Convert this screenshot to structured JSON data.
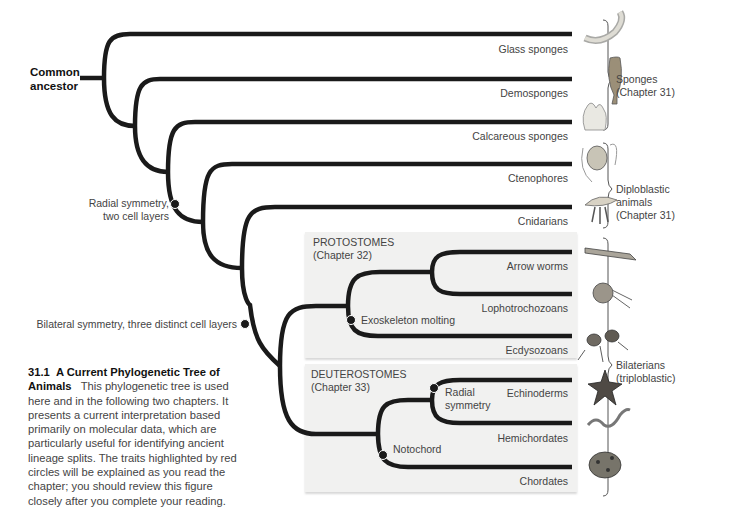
{
  "figure": {
    "root_label": [
      "Common",
      "ancestor"
    ],
    "taxa": [
      {
        "name": "Glass sponges",
        "icon": "glass-sponge-icon"
      },
      {
        "name": "Demosponges",
        "icon": "demosponge-icon"
      },
      {
        "name": "Calcareous sponges",
        "icon": "calcareous-sponge-icon"
      },
      {
        "name": "Ctenophores",
        "icon": "ctenophore-icon"
      },
      {
        "name": "Cnidarians",
        "icon": "jellyfish-icon"
      },
      {
        "name": "Arrow worms",
        "icon": "arrow-worm-icon"
      },
      {
        "name": "Lophotrochozoans",
        "icon": "nautilus-icon"
      },
      {
        "name": "Ecdysozoans",
        "icon": "mite-icon"
      },
      {
        "name": "Echinoderms",
        "icon": "starfish-icon"
      },
      {
        "name": "Hemichordates",
        "icon": "acorn-worm-icon"
      },
      {
        "name": "Chordates",
        "icon": "frog-icon"
      }
    ],
    "traits": {
      "radial_two_layers": [
        "Radial symmetry,",
        "two cell layers"
      ],
      "bilateral": "Bilateral symmetry, three distinct cell layers",
      "exoskeleton": "Exoskeleton molting",
      "radial_symmetry": [
        "Radial",
        "symmetry"
      ],
      "notochord": "Notochord"
    },
    "boxes": {
      "protostomes": {
        "title": "PROTOSTOMES",
        "chapter": "(Chapter 32)"
      },
      "deuterostomes": {
        "title": "DEUTEROSTOMES",
        "chapter": "(Chapter 33)"
      }
    },
    "groups": [
      {
        "name": "Sponges",
        "chapter": "(Chapter 31)"
      },
      {
        "name": "Diploblastic",
        "line2": "animals",
        "chapter": "(Chapter 31)"
      },
      {
        "name": "Bilaterians",
        "chapter": "(triploblastic)"
      }
    ],
    "colors": {
      "branch": "#1a1a1a",
      "trait_dot": "#1a1a1a",
      "box_bg": "#f1f1f0"
    }
  },
  "caption": {
    "number": "31.1",
    "title": "A Current Phylogenetic Tree of Animals",
    "body": "This phylogenetic tree is used here and in the following two chapters. It presents a current interpretation based primarily on molecular data, which are particularly useful for identifying ancient lineage splits. The traits highlighted by red circles will be explained as you read the chapter; you should review this figure closely after you complete your reading."
  }
}
